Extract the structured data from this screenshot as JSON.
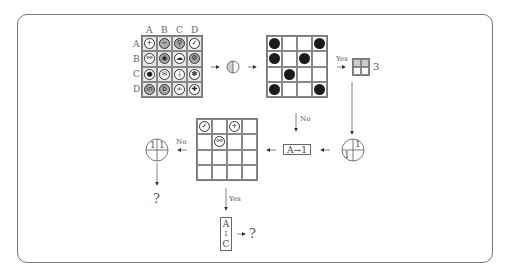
{
  "diagram": {
    "icon_grid": {
      "column_labels": [
        "A",
        "B",
        "C",
        "D"
      ],
      "row_labels": [
        "A",
        "B",
        "C",
        "D"
      ],
      "rows": [
        [
          {
            "icon": "plus",
            "glyph": "+",
            "dark": false
          },
          {
            "icon": "minus",
            "glyph": "−",
            "dark": true
          },
          {
            "icon": "search",
            "glyph": "⚲",
            "dark": true
          },
          {
            "icon": "check",
            "glyph": "✓",
            "dark": false
          }
        ],
        [
          {
            "icon": "link",
            "glyph": "⚯",
            "dark": false
          },
          {
            "icon": "eye",
            "glyph": "◉",
            "dark": true
          },
          {
            "icon": "cloud",
            "glyph": "☁",
            "dark": false
          },
          {
            "icon": "gear",
            "glyph": "⚙",
            "dark": true
          }
        ],
        [
          {
            "icon": "chat",
            "glyph": "●",
            "dark": false
          },
          {
            "icon": "mail",
            "glyph": "✉",
            "dark": false
          },
          {
            "icon": "download",
            "glyph": "⤓",
            "dark": false
          },
          {
            "icon": "puzzle",
            "glyph": "✽",
            "dark": false
          }
        ],
        [
          {
            "icon": "linkedin",
            "glyph": "in",
            "dark": true
          },
          {
            "icon": "b-letter",
            "glyph": "b",
            "dark": true
          },
          {
            "icon": "infinity",
            "glyph": "∞",
            "dark": false
          },
          {
            "icon": "plus-bold",
            "glyph": "✚",
            "dark": false
          }
        ]
      ]
    },
    "dot_grid": {
      "rows": [
        [
          1,
          0,
          0,
          1
        ],
        [
          1,
          0,
          1,
          0
        ],
        [
          0,
          1,
          0,
          0
        ],
        [
          1,
          0,
          0,
          1
        ]
      ]
    },
    "yes_label_top": "Yes",
    "small_grid_count": "3",
    "no_label_middle": "No",
    "mapping_box": "A→1",
    "circle_right": {
      "top_right": "1",
      "bottom_left": "1"
    },
    "result_grid": {
      "cells": [
        [
          "check",
          "",
          "plus",
          ""
        ],
        [
          "",
          "link",
          "",
          ""
        ],
        [
          "",
          "",
          "",
          ""
        ],
        [
          "",
          "",
          "",
          ""
        ]
      ],
      "glyphs": {
        "check": "✓",
        "plus": "+",
        "link": "⚯"
      }
    },
    "no_label_left": "No",
    "circle_left": {
      "left": "1",
      "right": "1"
    },
    "question_left": "?",
    "yes_label_bottom": "Yes",
    "range_box": {
      "top": "A",
      "bottom": "C",
      "arrow": "↕"
    },
    "question_bottom": "?"
  }
}
